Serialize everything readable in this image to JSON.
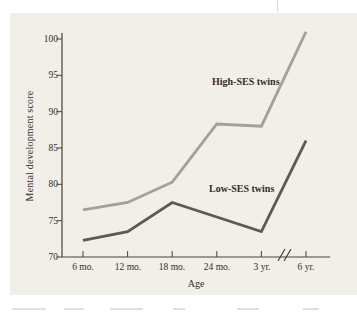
{
  "page": {
    "background": "#ffffff",
    "panel_background": "#f2efe8"
  },
  "chart_data": {
    "type": "line",
    "title": "",
    "xlabel": "Age",
    "ylabel": "Mental development score",
    "categories": [
      "6 mo.",
      "12 mo.",
      "18 mo.",
      "24 mo.",
      "3 yr.",
      "6 yr."
    ],
    "yticks": [
      70,
      75,
      80,
      85,
      90,
      95,
      100
    ],
    "ylim": [
      70,
      101
    ],
    "grid": false,
    "legend": "inline-labels",
    "axis_break_between": [
      "3 yr.",
      "6 yr."
    ],
    "axis_color": "#46413a",
    "series": [
      {
        "name": "High-SES twins",
        "values": [
          76.5,
          77.5,
          80.3,
          88.3,
          88,
          101
        ],
        "color": "#a3a09a"
      },
      {
        "name": "Low-SES twins",
        "values": [
          72.3,
          73.5,
          77.5,
          75.5,
          73.5,
          86
        ],
        "color": "#5e5951"
      }
    ]
  }
}
